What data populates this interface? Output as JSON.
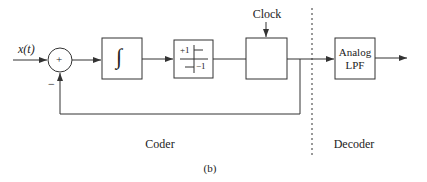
{
  "diagram": {
    "caption": "(b)",
    "input_label": "x(t)",
    "summer": {
      "sign_top": "+",
      "sign_feedback": "−"
    },
    "blocks": {
      "integrator": {
        "symbol": "∫"
      },
      "quantizer": {
        "plus_label": "+1",
        "minus_label": "−1"
      },
      "sampler": {
        "label": ""
      },
      "lpf": {
        "line1": "Analog",
        "line2": "LPF"
      }
    },
    "clock_label": "Clock",
    "sections": {
      "coder": "Coder",
      "decoder": "Decoder"
    },
    "colors": {
      "stroke": "#333333",
      "background": "#ffffff"
    }
  }
}
